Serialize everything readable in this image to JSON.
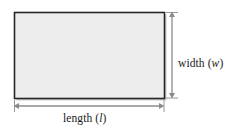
{
  "figure": {
    "kind": "geometry-diagram",
    "background_color": "#ffffff"
  },
  "shape": {
    "name": "rectangle",
    "fill_color": "#ededed",
    "border_color": "#262626",
    "shadow_color": "#9a9a9a",
    "x": 14,
    "y": 12,
    "width": 150,
    "height": 86
  },
  "dimensions": {
    "width": {
      "label_prefix": "width (",
      "variable": "w",
      "label_suffix": ")",
      "full_label": "width (w)",
      "arrow": "double-headed-vertical",
      "arrow_color": "#8c8c8c",
      "arrow_x": 172,
      "arrow_y1": 12,
      "arrow_y2": 98
    },
    "length": {
      "label_prefix": "length (",
      "variable": "l",
      "label_suffix": ")",
      "full_label": "length (l)",
      "arrow": "double-headed-horizontal",
      "arrow_color": "#8c8c8c",
      "arrow_y": 106,
      "arrow_x1": 14,
      "arrow_x2": 164
    }
  }
}
